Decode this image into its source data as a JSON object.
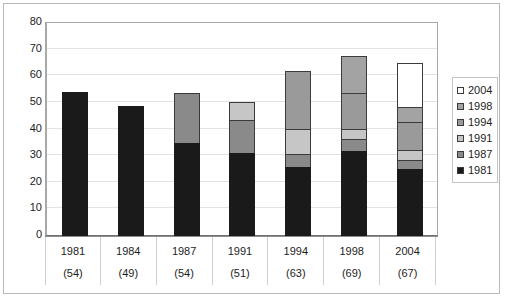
{
  "chart_data": {
    "type": "bar",
    "title": "",
    "subtitle": "",
    "xlabel": "",
    "ylabel": "",
    "ylim": [
      0,
      80
    ],
    "y_ticks": [
      0,
      10,
      20,
      30,
      40,
      50,
      60,
      70,
      80
    ],
    "grid": true,
    "stacked": true,
    "legend_position": "right",
    "categories": [
      "1981",
      "1984",
      "1987",
      "1991",
      "1994",
      "1998",
      "2004"
    ],
    "category_totals": [
      "(54)",
      "(49)",
      "(54)",
      "(51)",
      "(63)",
      "(69)",
      "(67)"
    ],
    "totals": [
      54,
      49,
      54,
      51,
      63,
      69,
      67
    ],
    "legend": [
      {
        "name": "2004",
        "color": "#ffffff"
      },
      {
        "name": "1998",
        "color": "#a3a3a3"
      },
      {
        "name": "1994",
        "color": "#9a9a9a"
      },
      {
        "name": "1991",
        "color": "#c6c6c6"
      },
      {
        "name": "1987",
        "color": "#8a8a8a"
      },
      {
        "name": "1981",
        "color": "#1a1a1a"
      }
    ],
    "series": [
      {
        "name": "1981",
        "color": "#1a1a1a",
        "values": [
          54,
          49,
          35,
          31,
          26,
          32,
          25
        ]
      },
      {
        "name": "1987",
        "color": "#8a8a8a",
        "values": [
          0,
          0,
          19,
          13,
          5,
          5,
          4
        ]
      },
      {
        "name": "1991",
        "color": "#c6c6c6",
        "values": [
          0,
          0,
          0,
          7,
          10,
          4,
          4
        ]
      },
      {
        "name": "1994",
        "color": "#9a9a9a",
        "values": [
          0,
          0,
          0,
          0,
          22,
          14,
          11
        ]
      },
      {
        "name": "1998",
        "color": "#a3a3a3",
        "values": [
          0,
          0,
          0,
          0,
          0,
          14,
          6
        ]
      },
      {
        "name": "2004",
        "color": "#ffffff",
        "values": [
          0,
          0,
          0,
          0,
          0,
          0,
          17
        ]
      }
    ]
  }
}
